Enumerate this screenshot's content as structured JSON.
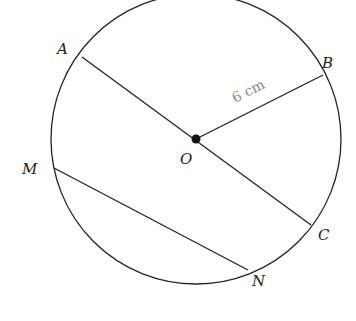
{
  "diagram": {
    "type": "circle-geometry",
    "center": {
      "label": "O",
      "x": 196,
      "y": 139
    },
    "radius_px": 145,
    "points": [
      {
        "label": "A",
        "x": 82,
        "y": 57
      },
      {
        "label": "B",
        "x": 323,
        "y": 75
      },
      {
        "label": "C",
        "x": 311,
        "y": 225
      },
      {
        "label": "M",
        "x": 54,
        "y": 168
      },
      {
        "label": "N",
        "x": 248,
        "y": 270
      }
    ],
    "segments": [
      {
        "from": "A",
        "to": "C",
        "kind": "diameter"
      },
      {
        "from": "O",
        "to": "B",
        "kind": "radius"
      },
      {
        "from": "M",
        "to": "N",
        "kind": "chord"
      }
    ],
    "measurement": "6 cm"
  },
  "labels": {
    "A": "A",
    "B": "B",
    "C": "C",
    "M": "M",
    "N": "N",
    "O": "O"
  }
}
